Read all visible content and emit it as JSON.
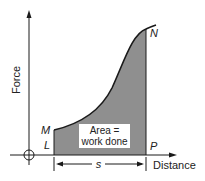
{
  "diagram": {
    "y_axis_label": "Force",
    "x_axis_label": "Distance",
    "points": {
      "M": "M",
      "L": "L",
      "N": "N",
      "P": "P"
    },
    "area_label_line1": "Area =",
    "area_label_line2": "work done",
    "displacement_label": "s",
    "colors": {
      "fill": "#8f8f8f",
      "line": "#1a1a1a",
      "background": "#ffffff"
    }
  }
}
